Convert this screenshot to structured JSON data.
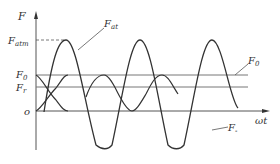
{
  "diagram": {
    "axis": {
      "y_label": "F",
      "x_label": "ωt",
      "origin_label": "o"
    },
    "levels": {
      "F_atm": {
        "label": "F",
        "sub": "atm"
      },
      "F_0": {
        "label": "F",
        "sub": "0"
      },
      "F_r": {
        "label": "F",
        "sub": "r"
      }
    },
    "curves": {
      "F_at": {
        "label": "F",
        "sub": "at"
      },
      "F_minus": {
        "label": "F",
        "sub": "-"
      },
      "F_0_right": {
        "label": "F",
        "sub": "0"
      }
    },
    "colors": {
      "line": "#333333",
      "grid": "#777777",
      "background": "#ffffff"
    }
  }
}
